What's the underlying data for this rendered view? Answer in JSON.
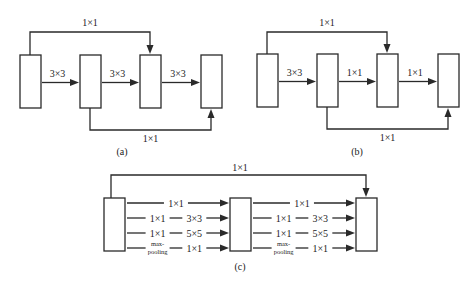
{
  "panels": [
    {
      "id": "a",
      "caption": "(a)",
      "blocks": 4,
      "arrows": [
        "3×3",
        "3×3",
        "3×3"
      ],
      "top_skip": {
        "label": "1×1",
        "from_block": 1,
        "to_block": 3
      },
      "bottom_skip": {
        "label": "1×1",
        "from_block": 2,
        "to_block": 4
      }
    },
    {
      "id": "b",
      "caption": "(b)",
      "blocks": 4,
      "arrows": [
        "3×3",
        "1×1",
        "1×1"
      ],
      "top_skip": {
        "label": "1×1",
        "from_block": 1,
        "to_block": 3
      },
      "bottom_skip": {
        "label": "1×1",
        "from_block": 2,
        "to_block": 4
      }
    },
    {
      "id": "c",
      "caption": "(c)",
      "blocks": 3,
      "top_skip": {
        "label": "1×1",
        "from_block": 1,
        "to_block": 3
      },
      "branches": [
        {
          "first": "",
          "second": "1×1"
        },
        {
          "first": "1×1",
          "second": "3×3"
        },
        {
          "first": "1×1",
          "second": "5×5"
        },
        {
          "first": "max-pooling",
          "first_lines": [
            "max-",
            "pooling"
          ],
          "second": "1×1"
        }
      ]
    }
  ]
}
